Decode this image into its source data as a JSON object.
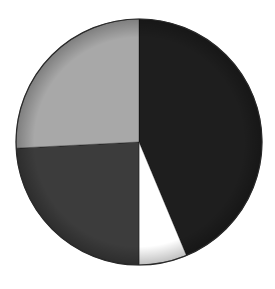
{
  "chart_data": {
    "type": "pie",
    "title": "",
    "legend": null,
    "labels_visible": false,
    "start_angle_deg": 0,
    "direction": "clockwise",
    "center": [
      139,
      142
    ],
    "radius": 123,
    "slices": [
      {
        "name": "slice-1",
        "value": 43.7,
        "color": "#1e1e1e"
      },
      {
        "name": "slice-2",
        "value": 6.3,
        "color": "#ffffff"
      },
      {
        "name": "slice-3",
        "value": 24.2,
        "color": "#3c3c3c"
      },
      {
        "name": "slice-4",
        "value": 25.8,
        "color": "#a8a8a8"
      }
    ],
    "values": [
      43.7,
      6.3,
      24.2,
      25.8
    ],
    "categories": [
      "slice-1",
      "slice-2",
      "slice-3",
      "slice-4"
    ],
    "border_color": "#2a2a2a",
    "style": "3d-beveled shading, no labels"
  }
}
